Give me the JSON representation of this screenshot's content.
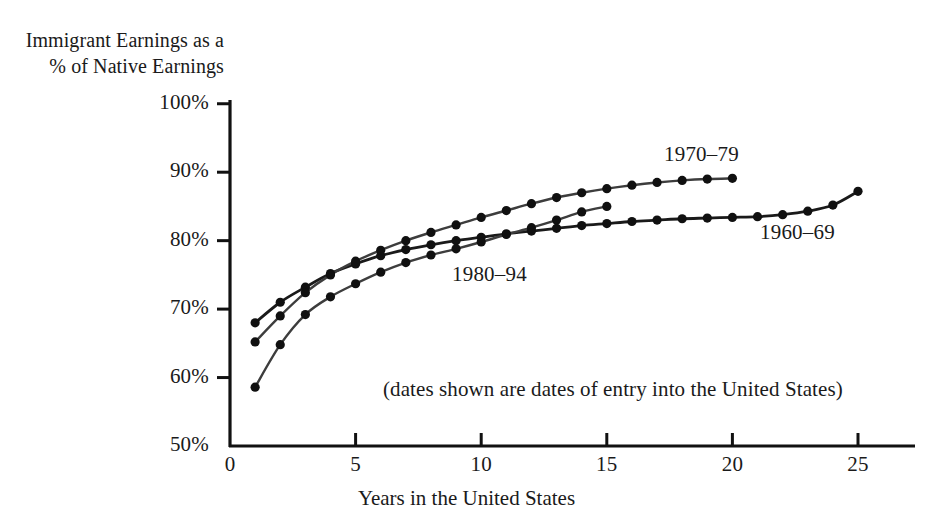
{
  "chart_data": {
    "type": "line",
    "title": "",
    "ylabel": "Immigrant Earnings as a % of Native Earnings",
    "ylabel_line1": "Immigrant Earnings as a",
    "ylabel_line2": "% of Native Earnings",
    "xlabel": "Years in the United States",
    "note": "(dates shown are dates of entry into the United States)",
    "xlim": [
      0,
      26
    ],
    "ylim": [
      50,
      100
    ],
    "grid": false,
    "legend_position": "inline-annotations",
    "yticks": [
      50,
      60,
      70,
      80,
      90,
      100
    ],
    "ytick_labels": [
      "50%",
      "60%",
      "70%",
      "80%",
      "90%",
      "100%"
    ],
    "xticks": [
      0,
      5,
      10,
      15,
      20,
      25
    ],
    "xtick_labels": [
      "0",
      "5",
      "10",
      "15",
      "20",
      "25"
    ],
    "marker": "circle",
    "series": [
      {
        "name": "1960–69",
        "label": "1960–69",
        "color": "#1a1a1a",
        "x": [
          1,
          2,
          3,
          4,
          5,
          6,
          7,
          8,
          9,
          10,
          11,
          12,
          13,
          14,
          15,
          16,
          17,
          18,
          19,
          20,
          21,
          22,
          23,
          24,
          25
        ],
        "values": [
          68.0,
          71.0,
          73.2,
          75.2,
          76.6,
          77.8,
          78.7,
          79.4,
          80.0,
          80.5,
          81.0,
          81.4,
          81.8,
          82.2,
          82.5,
          82.8,
          83.0,
          83.2,
          83.3,
          83.4,
          83.5,
          83.8,
          84.3,
          85.2,
          87.2
        ]
      },
      {
        "name": "1970–79",
        "label": "1970–79",
        "color": "#3d3d3d",
        "x": [
          1,
          2,
          3,
          4,
          5,
          6,
          7,
          8,
          9,
          10,
          11,
          12,
          13,
          14,
          15,
          16,
          17,
          18,
          19,
          20
        ],
        "values": [
          65.2,
          69.0,
          72.4,
          75.0,
          77.0,
          78.6,
          80.0,
          81.2,
          82.3,
          83.4,
          84.4,
          85.4,
          86.3,
          87.0,
          87.6,
          88.1,
          88.5,
          88.8,
          89.0,
          89.1
        ]
      },
      {
        "name": "1980–94",
        "label": "1980–94",
        "color": "#3d3d3d",
        "x": [
          1,
          2,
          3,
          4,
          5,
          6,
          7,
          8,
          9,
          10,
          11,
          12,
          13,
          14,
          15
        ],
        "values": [
          58.6,
          64.8,
          69.2,
          71.8,
          73.7,
          75.4,
          76.8,
          77.9,
          78.8,
          79.8,
          80.9,
          81.9,
          83.0,
          84.2,
          85.0
        ]
      }
    ],
    "annotations": [
      {
        "text": "1970–79",
        "series": "1970–79",
        "x_px": 664,
        "y_px": 142
      },
      {
        "text": "1960–69",
        "series": "1960–69",
        "x_px": 760,
        "y_px": 220
      },
      {
        "text": "1980–94",
        "series": "1980–94",
        "x_px": 452,
        "y_px": 262
      }
    ]
  },
  "axes": {
    "line_color": "#111111",
    "background": "#ffffff"
  }
}
